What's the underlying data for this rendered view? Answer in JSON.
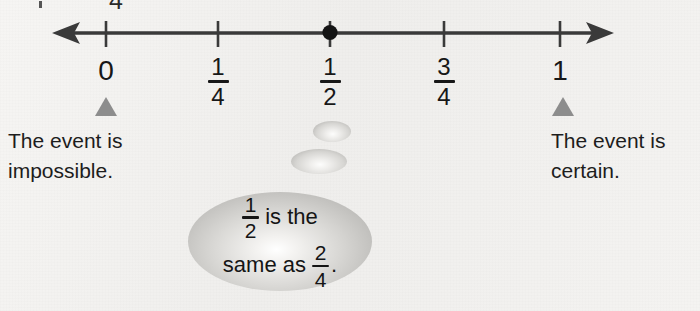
{
  "page": {
    "kind": "probability-number-line-figure",
    "background_color": "#f3f2f0"
  },
  "top_clipped": {
    "visible_text": "4",
    "note_speck": "•"
  },
  "number_line": {
    "axis_color": "#3a3a3a",
    "left_arrow_icon": "left-arrow",
    "right_arrow_icon": "right-arrow",
    "point_marker": {
      "icon": "filled-dot",
      "at_label": "1/2",
      "x_value": 0.5,
      "color": "#1a1a1a"
    },
    "ticks": [
      {
        "label_type": "whole",
        "text": "0",
        "value": 0,
        "x": 106
      },
      {
        "label_type": "fraction",
        "numerator": "1",
        "denominator": "4",
        "value": 0.25,
        "x": 218
      },
      {
        "label_type": "fraction",
        "numerator": "1",
        "denominator": "2",
        "value": 0.5,
        "x": 330
      },
      {
        "label_type": "fraction",
        "numerator": "3",
        "denominator": "4",
        "value": 0.75,
        "x": 444
      },
      {
        "label_type": "whole",
        "text": "1",
        "value": 1,
        "x": 560
      }
    ]
  },
  "pointers": [
    {
      "name": "impossible",
      "x": 106,
      "color": "#8d8d8d"
    },
    {
      "name": "certain",
      "x": 563,
      "color": "#8d8d8d"
    }
  ],
  "captions": {
    "impossible": "The event is\nimpossible.",
    "certain": "The event is\ncertain."
  },
  "thought_bubble": {
    "line_1": {
      "fraction": {
        "numerator": "1",
        "denominator": "2"
      },
      "words": "is the"
    },
    "line_2": {
      "words": "same as",
      "fraction": {
        "numerator": "2",
        "denominator": "4"
      },
      "trailing": "."
    },
    "full_text": "1/2 is the same as 2/4.",
    "fill_color": "#c9c8c5"
  }
}
